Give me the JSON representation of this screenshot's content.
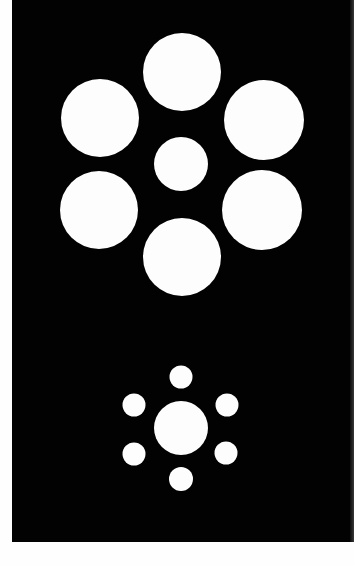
{
  "illusion": {
    "name": "Ebbinghaus illusion",
    "colors": {
      "background": "#fefefe",
      "panel": "#020202",
      "circle": "#fdfdfd"
    },
    "clusters": [
      {
        "id": "large-surround",
        "center": {
          "cx": 181,
          "cy": 164,
          "r": 27
        },
        "surround": [
          {
            "cx": 182,
            "cy": 72,
            "r": 39
          },
          {
            "cx": 100,
            "cy": 118,
            "r": 39
          },
          {
            "cx": 264,
            "cy": 120,
            "r": 40
          },
          {
            "cx": 99,
            "cy": 210,
            "r": 39
          },
          {
            "cx": 262,
            "cy": 210,
            "r": 40
          },
          {
            "cx": 182,
            "cy": 257,
            "r": 39
          }
        ]
      },
      {
        "id": "small-surround",
        "center": {
          "cx": 181,
          "cy": 428,
          "r": 27
        },
        "surround": [
          {
            "cx": 181,
            "cy": 377,
            "r": 11.5
          },
          {
            "cx": 134,
            "cy": 405,
            "r": 11.5
          },
          {
            "cx": 227,
            "cy": 405,
            "r": 11.5
          },
          {
            "cx": 134,
            "cy": 454,
            "r": 11.5
          },
          {
            "cx": 226,
            "cy": 453,
            "r": 11.5
          },
          {
            "cx": 181,
            "cy": 479,
            "r": 12
          }
        ]
      }
    ]
  }
}
